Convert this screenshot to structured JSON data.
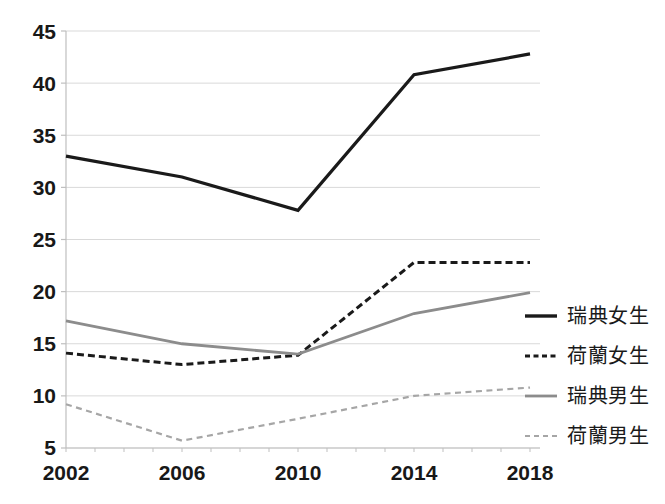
{
  "chart_data": {
    "type": "line",
    "title": "",
    "subtitle": "",
    "xlabel": "",
    "ylabel": "",
    "x": [
      2002,
      2006,
      2010,
      2014,
      2018
    ],
    "categories": [
      "2002",
      "2006",
      "2010",
      "2014",
      "2018"
    ],
    "xlim": [
      2002,
      2018
    ],
    "ylim": [
      5,
      45
    ],
    "yticks": [
      5,
      10,
      15,
      20,
      25,
      30,
      35,
      40,
      45
    ],
    "ytick_labels": [
      "5",
      "10",
      "15",
      "20",
      "25",
      "30",
      "35",
      "40",
      "45"
    ],
    "xtick_labels": [
      "2002",
      "2006",
      "2010",
      "2014",
      "2018"
    ],
    "grid": "horizontal",
    "legend_position": "right",
    "series": [
      {
        "name": "瑞典女生",
        "values": [
          33.0,
          31.0,
          27.8,
          40.8,
          42.8
        ],
        "color": "#1a1a1a",
        "style": "solid",
        "width": 3.2
      },
      {
        "name": "荷蘭女生",
        "values": [
          14.1,
          13.0,
          13.9,
          22.8,
          22.8
        ],
        "color": "#1a1a1a",
        "style": "dashed",
        "width": 3.0
      },
      {
        "name": "瑞典男生",
        "values": [
          17.2,
          15.0,
          14.0,
          17.9,
          19.9
        ],
        "color": "#8c8c8c",
        "style": "solid",
        "width": 2.8
      },
      {
        "name": "荷蘭男生",
        "values": [
          9.2,
          5.7,
          7.8,
          10.0,
          10.8
        ],
        "color": "#a6a6a6",
        "style": "dashed",
        "width": 2.2
      }
    ]
  },
  "axes": {
    "y_ticks": [
      {
        "label": "45"
      },
      {
        "label": "40"
      },
      {
        "label": "35"
      },
      {
        "label": "30"
      },
      {
        "label": "25"
      },
      {
        "label": "20"
      },
      {
        "label": "15"
      },
      {
        "label": "10"
      },
      {
        "label": "5"
      }
    ],
    "x_ticks": [
      {
        "label": "2002"
      },
      {
        "label": "2006"
      },
      {
        "label": "2010"
      },
      {
        "label": "2014"
      },
      {
        "label": "2018"
      }
    ]
  },
  "legend": {
    "items": [
      {
        "label": "瑞典女生",
        "color": "#1a1a1a",
        "style": "solid",
        "icon": "line-solid-icon"
      },
      {
        "label": "荷蘭女生",
        "color": "#1a1a1a",
        "style": "dashed",
        "icon": "line-dashed-icon"
      },
      {
        "label": "瑞典男生",
        "color": "#8c8c8c",
        "style": "solid",
        "icon": "line-solid-icon"
      },
      {
        "label": "荷蘭男生",
        "color": "#a6a6a6",
        "style": "dashed",
        "icon": "line-dashed-icon"
      }
    ]
  },
  "colors": {
    "grid": "#d9d9d9",
    "axis": "#bfbfbf",
    "text": "#181818",
    "background": "#ffffff"
  }
}
